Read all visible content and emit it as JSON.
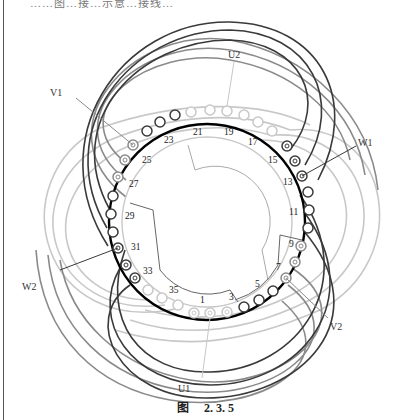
{
  "page": {
    "top_text_cut": "……图…接…示意…接线…",
    "caption": {
      "prefix": "图",
      "number": "2. 3. 5"
    }
  },
  "diagram": {
    "type": "stator-winding-connection",
    "slots": [
      "1",
      "3",
      "5",
      "7",
      "9",
      "11",
      "13",
      "15",
      "17",
      "19",
      "21",
      "23",
      "25",
      "27",
      "29",
      "31",
      "33",
      "35"
    ],
    "terminals": {
      "U1": "U1",
      "U2": "U2",
      "V1": "V1",
      "V2": "V2",
      "W1": "W1",
      "W2": "W2"
    },
    "colors": {
      "ring": "#000000",
      "phase_dark": "#3a3a3a",
      "phase_mid": "#8a8a8a",
      "phase_light": "#c8c8c8"
    }
  }
}
